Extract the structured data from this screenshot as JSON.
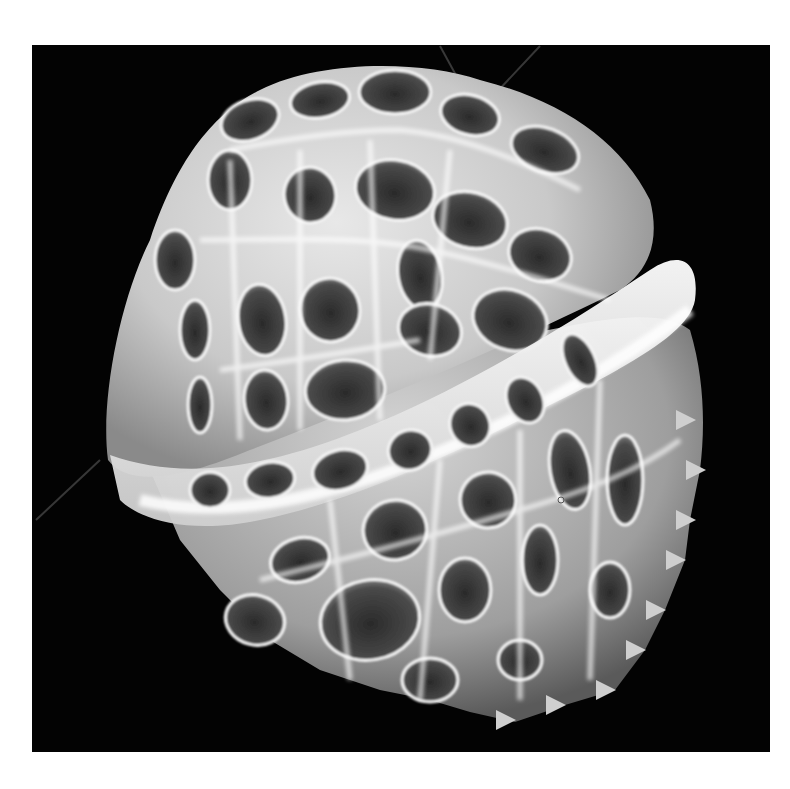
{
  "image": {
    "kind": "SEM micrograph",
    "subject": "reticulate dinoflagellate cyst",
    "background_color": "#030303",
    "page_color": "#ffffff",
    "frame": {
      "x": 32,
      "y": 45,
      "width": 738,
      "height": 707
    },
    "specimen": {
      "body_fill": "#d9d9d9",
      "muri_color": "#f4f4f4",
      "lumen_color": "#3a3a3a",
      "epicyst_lumina": [
        {
          "cx": 250,
          "cy": 120,
          "rx": 30,
          "ry": 20,
          "r": -20
        },
        {
          "cx": 320,
          "cy": 100,
          "rx": 30,
          "ry": 18,
          "r": -10
        },
        {
          "cx": 395,
          "cy": 92,
          "rx": 36,
          "ry": 22,
          "r": 0
        },
        {
          "cx": 470,
          "cy": 115,
          "rx": 30,
          "ry": 20,
          "r": 15
        },
        {
          "cx": 545,
          "cy": 150,
          "rx": 35,
          "ry": 22,
          "r": 20
        },
        {
          "cx": 230,
          "cy": 180,
          "rx": 22,
          "ry": 30,
          "r": 0
        },
        {
          "cx": 310,
          "cy": 195,
          "rx": 26,
          "ry": 28,
          "r": -10
        },
        {
          "cx": 395,
          "cy": 190,
          "rx": 40,
          "ry": 30,
          "r": 10
        },
        {
          "cx": 470,
          "cy": 220,
          "rx": 38,
          "ry": 28,
          "r": 15
        },
        {
          "cx": 540,
          "cy": 255,
          "rx": 32,
          "ry": 26,
          "r": 20
        },
        {
          "cx": 175,
          "cy": 260,
          "rx": 20,
          "ry": 30,
          "r": 0
        },
        {
          "cx": 420,
          "cy": 275,
          "rx": 22,
          "ry": 35,
          "r": -10
        },
        {
          "cx": 510,
          "cy": 320,
          "rx": 38,
          "ry": 30,
          "r": 20
        },
        {
          "cx": 262,
          "cy": 320,
          "rx": 24,
          "ry": 36,
          "r": -8
        },
        {
          "cx": 330,
          "cy": 310,
          "rx": 30,
          "ry": 32,
          "r": -10
        },
        {
          "cx": 430,
          "cy": 330,
          "rx": 32,
          "ry": 26,
          "r": 15
        },
        {
          "cx": 195,
          "cy": 330,
          "rx": 15,
          "ry": 30,
          "r": 0
        },
        {
          "cx": 266,
          "cy": 400,
          "rx": 22,
          "ry": 30,
          "r": -5
        },
        {
          "cx": 345,
          "cy": 390,
          "rx": 40,
          "ry": 30,
          "r": -5
        },
        {
          "cx": 200,
          "cy": 405,
          "rx": 12,
          "ry": 28,
          "r": 0
        }
      ],
      "hypocyst_lumina": [
        {
          "cx": 210,
          "cy": 490,
          "rx": 20,
          "ry": 18,
          "r": 0
        },
        {
          "cx": 270,
          "cy": 480,
          "rx": 25,
          "ry": 18,
          "r": -10
        },
        {
          "cx": 340,
          "cy": 470,
          "rx": 28,
          "ry": 20,
          "r": -15
        },
        {
          "cx": 410,
          "cy": 450,
          "rx": 22,
          "ry": 20,
          "r": -20
        },
        {
          "cx": 470,
          "cy": 425,
          "rx": 20,
          "ry": 22,
          "r": -25
        },
        {
          "cx": 525,
          "cy": 400,
          "rx": 18,
          "ry": 24,
          "r": -25
        },
        {
          "cx": 580,
          "cy": 360,
          "rx": 15,
          "ry": 28,
          "r": -25
        },
        {
          "cx": 300,
          "cy": 560,
          "rx": 30,
          "ry": 22,
          "r": -15
        },
        {
          "cx": 395,
          "cy": 530,
          "rx": 32,
          "ry": 30,
          "r": -10
        },
        {
          "cx": 488,
          "cy": 500,
          "rx": 28,
          "ry": 28,
          "r": -10
        },
        {
          "cx": 570,
          "cy": 470,
          "rx": 20,
          "ry": 40,
          "r": -10
        },
        {
          "cx": 370,
          "cy": 620,
          "rx": 50,
          "ry": 40,
          "r": -10
        },
        {
          "cx": 465,
          "cy": 590,
          "rx": 26,
          "ry": 32,
          "r": 0
        },
        {
          "cx": 540,
          "cy": 560,
          "rx": 18,
          "ry": 35,
          "r": 0
        },
        {
          "cx": 625,
          "cy": 480,
          "rx": 18,
          "ry": 45,
          "r": 0
        },
        {
          "cx": 255,
          "cy": 620,
          "rx": 30,
          "ry": 25,
          "r": 15
        },
        {
          "cx": 430,
          "cy": 680,
          "rx": 28,
          "ry": 22,
          "r": 0
        },
        {
          "cx": 520,
          "cy": 660,
          "rx": 22,
          "ry": 20,
          "r": 0
        },
        {
          "cx": 610,
          "cy": 590,
          "rx": 20,
          "ry": 28,
          "r": 0
        }
      ],
      "spines": [
        {
          "x": 690,
          "y": 420
        },
        {
          "x": 700,
          "y": 470
        },
        {
          "x": 690,
          "y": 520
        },
        {
          "x": 680,
          "y": 560
        },
        {
          "x": 660,
          "y": 610
        },
        {
          "x": 640,
          "y": 650
        },
        {
          "x": 610,
          "y": 690
        },
        {
          "x": 560,
          "y": 705
        },
        {
          "x": 510,
          "y": 720
        }
      ]
    }
  }
}
